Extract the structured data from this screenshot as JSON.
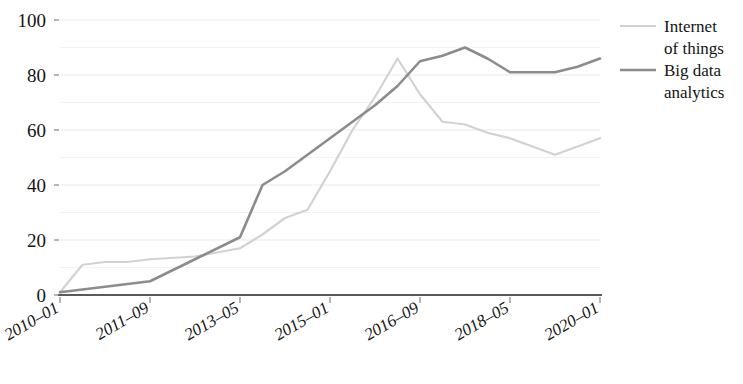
{
  "chart_data": {
    "type": "line",
    "title": "",
    "subtitle": "",
    "xlabel": "",
    "ylabel": "",
    "xlim": [
      0,
      24
    ],
    "ylim": [
      0,
      100
    ],
    "grid": true,
    "grid_values": [
      0,
      10,
      20,
      30,
      40,
      50,
      60,
      70,
      80,
      90,
      100
    ],
    "legend_position": "right",
    "y_ticks": [
      {
        "value": 0,
        "label": "0"
      },
      {
        "value": 20,
        "label": "20"
      },
      {
        "value": 40,
        "label": "40"
      },
      {
        "value": 60,
        "label": "60"
      },
      {
        "value": 80,
        "label": "80"
      },
      {
        "value": 100,
        "label": "100"
      }
    ],
    "x_ticks": [
      {
        "index": 0,
        "label": "2010–01"
      },
      {
        "index": 4,
        "label": "2011–09"
      },
      {
        "index": 8,
        "label": "2013–05"
      },
      {
        "index": 12,
        "label": "2015–01"
      },
      {
        "index": 16,
        "label": "2016–09"
      },
      {
        "index": 20,
        "label": "2018–05"
      },
      {
        "index": 24,
        "label": "2020–01"
      }
    ],
    "categories": [
      "2010–01",
      "2010–06",
      "2010–11",
      "2011–04",
      "2011–09",
      "2012–02",
      "2012–07",
      "2012–12",
      "2013–05",
      "2013–10",
      "2014–03",
      "2014–08",
      "2015–01",
      "2015–06",
      "2015–11",
      "2016–04",
      "2016–09",
      "2017–02",
      "2017–07",
      "2017–12",
      "2018–05",
      "2018–10",
      "2019–03",
      "2019–08",
      "2020–01"
    ],
    "series": [
      {
        "name": "Internet of things",
        "color": "#d2d2d2",
        "width": 2.2,
        "x": [
          0,
          1,
          2,
          3,
          4,
          6,
          8,
          9,
          10,
          11,
          12,
          13,
          14,
          15,
          16,
          17,
          18,
          19,
          20,
          21,
          22,
          23,
          24
        ],
        "values": [
          1,
          11,
          12,
          12,
          13,
          14,
          17,
          22,
          28,
          31,
          45,
          60,
          72,
          86,
          73,
          63,
          62,
          59,
          57,
          54,
          51,
          54,
          57
        ]
      },
      {
        "name": "Big data analytics",
        "color": "#8c8c8c",
        "width": 2.6,
        "x": [
          0,
          1,
          2,
          3,
          4,
          6,
          8,
          9,
          10,
          11,
          12,
          13,
          14,
          15,
          16,
          17,
          18,
          19,
          20,
          21,
          22,
          23,
          24
        ],
        "values": [
          1,
          2,
          3,
          4,
          5,
          13,
          21,
          40,
          45,
          51,
          57,
          63,
          69,
          76,
          85,
          87,
          90,
          86,
          81,
          81,
          81,
          83,
          86
        ]
      }
    ]
  },
  "legend": {
    "entries": [
      {
        "label_line1": "Internet",
        "label_line2": "of things",
        "color": "#d2d2d2"
      },
      {
        "label_line1": "Big data",
        "label_line2": "analytics",
        "color": "#8c8c8c"
      }
    ]
  }
}
